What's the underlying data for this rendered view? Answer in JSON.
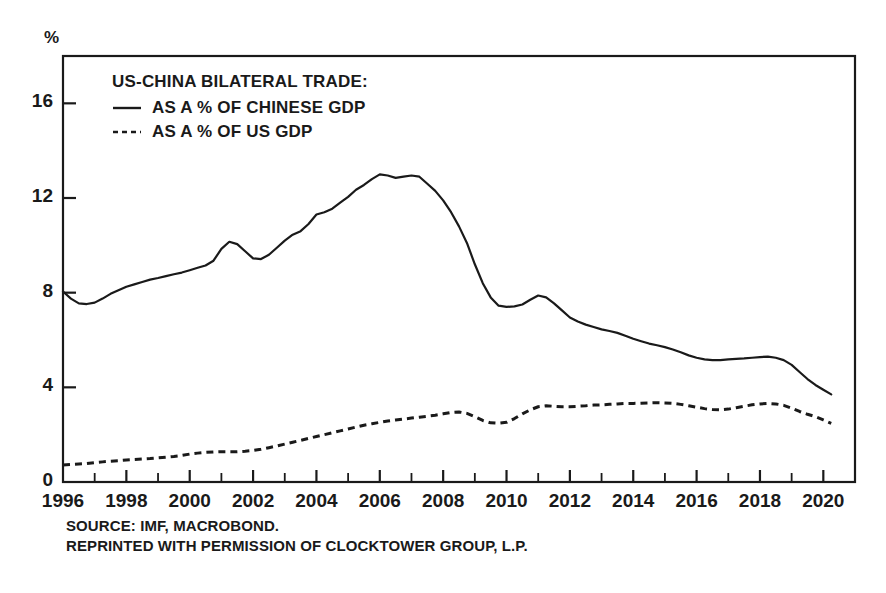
{
  "figure": {
    "unit_label": "%",
    "legend": {
      "title": "US-CHINA BILATERAL TRADE:",
      "entries": [
        {
          "label": "AS A % OF CHINESE GDP",
          "style": "solid",
          "swatch": "solid-line-icon"
        },
        {
          "label": "AS A % OF US GDP",
          "style": "dashed",
          "swatch": "dashed-line-icon"
        }
      ]
    },
    "footnote_lines": [
      "SOURCE: IMF, MACROBOND.",
      "REPRINTED WITH PERMISSION OF CLOCKTOWER GROUP, L.P."
    ],
    "colors": {
      "ink": "#1a1a1a",
      "background": "#ffffff",
      "axis": "#1a1a1a",
      "series_chinese_gdp": "#2b2b2b",
      "series_us_gdp": "#2b2b2b"
    }
  },
  "chart_data": {
    "type": "line",
    "title": "US-CHINA BILATERAL TRADE:",
    "subtitle": "",
    "xlabel": "",
    "ylabel": "%",
    "xlim": [
      1996.0,
      2021.0
    ],
    "ylim": [
      0,
      18
    ],
    "yticks": [
      0,
      4,
      8,
      12,
      16
    ],
    "ytick_labels": [
      "0",
      "4",
      "8",
      "12",
      "16"
    ],
    "xticks": [
      1996,
      1998,
      2000,
      2002,
      2004,
      2006,
      2008,
      2010,
      2012,
      2014,
      2016,
      2018,
      2020
    ],
    "xtick_labels": [
      "1996",
      "1998",
      "2000",
      "2002",
      "2004",
      "2006",
      "2008",
      "2010",
      "2012",
      "2014",
      "2016",
      "2018",
      "2020"
    ],
    "x_minor_tick_interval": 1,
    "grid": false,
    "legend_position": "upper-left-inside",
    "series": [
      {
        "name": "AS A % OF CHINESE GDP",
        "style": "solid",
        "x": [
          1996.0,
          1996.25,
          1996.5,
          1996.75,
          1997.0,
          1997.25,
          1997.5,
          1997.75,
          1998.0,
          1998.25,
          1998.5,
          1998.75,
          1999.0,
          1999.25,
          1999.5,
          1999.75,
          2000.0,
          2000.25,
          2000.5,
          2000.75,
          2001.0,
          2001.25,
          2001.5,
          2001.75,
          2002.0,
          2002.25,
          2002.5,
          2002.75,
          2003.0,
          2003.25,
          2003.5,
          2003.75,
          2004.0,
          2004.25,
          2004.5,
          2004.75,
          2005.0,
          2005.25,
          2005.5,
          2005.75,
          2006.0,
          2006.25,
          2006.5,
          2006.75,
          2007.0,
          2007.25,
          2007.5,
          2007.75,
          2008.0,
          2008.25,
          2008.5,
          2008.75,
          2009.0,
          2009.25,
          2009.5,
          2009.75,
          2010.0,
          2010.25,
          2010.5,
          2010.75,
          2011.0,
          2011.25,
          2011.5,
          2011.75,
          2012.0,
          2012.25,
          2012.5,
          2012.75,
          2013.0,
          2013.25,
          2013.5,
          2013.75,
          2014.0,
          2014.25,
          2014.5,
          2014.75,
          2015.0,
          2015.25,
          2015.5,
          2015.75,
          2016.0,
          2016.25,
          2016.5,
          2016.75,
          2017.0,
          2017.25,
          2017.5,
          2017.75,
          2018.0,
          2018.25,
          2018.5,
          2018.75,
          2019.0,
          2019.25,
          2019.5,
          2019.75,
          2020.0,
          2020.25
        ],
        "y": [
          8.05,
          7.75,
          7.55,
          7.52,
          7.58,
          7.75,
          7.95,
          8.1,
          8.25,
          8.35,
          8.45,
          8.55,
          8.62,
          8.7,
          8.78,
          8.85,
          8.95,
          9.05,
          9.15,
          9.35,
          9.85,
          10.15,
          10.05,
          9.75,
          9.45,
          9.42,
          9.6,
          9.9,
          10.2,
          10.45,
          10.6,
          10.9,
          11.3,
          11.4,
          11.55,
          11.8,
          12.05,
          12.35,
          12.55,
          12.8,
          13.0,
          12.95,
          12.85,
          12.9,
          12.95,
          12.9,
          12.6,
          12.3,
          11.9,
          11.4,
          10.8,
          10.1,
          9.2,
          8.4,
          7.8,
          7.45,
          7.4,
          7.42,
          7.5,
          7.7,
          7.88,
          7.8,
          7.55,
          7.25,
          6.95,
          6.78,
          6.65,
          6.55,
          6.45,
          6.38,
          6.3,
          6.18,
          6.05,
          5.95,
          5.85,
          5.78,
          5.7,
          5.6,
          5.48,
          5.35,
          5.25,
          5.18,
          5.15,
          5.15,
          5.18,
          5.2,
          5.22,
          5.25,
          5.28,
          5.3,
          5.25,
          5.15,
          4.95,
          4.65,
          4.35,
          4.1,
          3.9,
          3.7
        ]
      },
      {
        "name": "AS A % OF US GDP",
        "style": "dashed",
        "x": [
          1996.0,
          1996.25,
          1996.5,
          1996.75,
          1997.0,
          1997.25,
          1997.5,
          1997.75,
          1998.0,
          1998.25,
          1998.5,
          1998.75,
          1999.0,
          1999.25,
          1999.5,
          1999.75,
          2000.0,
          2000.25,
          2000.5,
          2000.75,
          2001.0,
          2001.25,
          2001.5,
          2001.75,
          2002.0,
          2002.25,
          2002.5,
          2002.75,
          2003.0,
          2003.25,
          2003.5,
          2003.75,
          2004.0,
          2004.25,
          2004.5,
          2004.75,
          2005.0,
          2005.25,
          2005.5,
          2005.75,
          2006.0,
          2006.25,
          2006.5,
          2006.75,
          2007.0,
          2007.25,
          2007.5,
          2007.75,
          2008.0,
          2008.25,
          2008.5,
          2008.75,
          2009.0,
          2009.25,
          2009.5,
          2009.75,
          2010.0,
          2010.25,
          2010.5,
          2010.75,
          2011.0,
          2011.25,
          2011.5,
          2011.75,
          2012.0,
          2012.25,
          2012.5,
          2012.75,
          2013.0,
          2013.25,
          2013.5,
          2013.75,
          2014.0,
          2014.25,
          2014.5,
          2014.75,
          2015.0,
          2015.25,
          2015.5,
          2015.75,
          2016.0,
          2016.25,
          2016.5,
          2016.75,
          2017.0,
          2017.25,
          2017.5,
          2017.75,
          2018.0,
          2018.25,
          2018.5,
          2018.75,
          2019.0,
          2019.25,
          2019.5,
          2019.75,
          2020.0,
          2020.25
        ],
        "y": [
          0.72,
          0.74,
          0.76,
          0.78,
          0.82,
          0.85,
          0.88,
          0.9,
          0.93,
          0.95,
          0.97,
          0.99,
          1.02,
          1.05,
          1.08,
          1.12,
          1.18,
          1.22,
          1.25,
          1.27,
          1.28,
          1.28,
          1.28,
          1.3,
          1.33,
          1.38,
          1.45,
          1.52,
          1.6,
          1.68,
          1.76,
          1.84,
          1.92,
          2.0,
          2.08,
          2.16,
          2.24,
          2.32,
          2.4,
          2.46,
          2.52,
          2.58,
          2.62,
          2.66,
          2.7,
          2.74,
          2.78,
          2.82,
          2.88,
          2.94,
          2.96,
          2.9,
          2.76,
          2.6,
          2.5,
          2.48,
          2.52,
          2.68,
          2.88,
          3.05,
          3.18,
          3.22,
          3.2,
          3.18,
          3.18,
          3.2,
          3.22,
          3.25,
          3.26,
          3.28,
          3.3,
          3.32,
          3.32,
          3.33,
          3.34,
          3.35,
          3.34,
          3.32,
          3.28,
          3.22,
          3.16,
          3.1,
          3.06,
          3.05,
          3.08,
          3.14,
          3.2,
          3.26,
          3.3,
          3.32,
          3.3,
          3.24,
          3.12,
          2.98,
          2.86,
          2.76,
          2.62,
          2.48
        ]
      }
    ]
  }
}
